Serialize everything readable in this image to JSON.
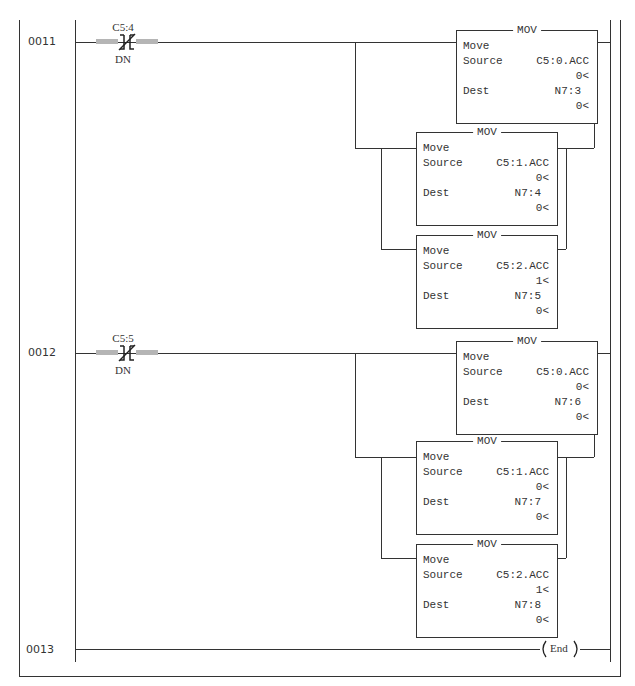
{
  "rungs": [
    {
      "number": "0011",
      "contact": {
        "address": "C5:4",
        "bit": "DN",
        "type": "XIO"
      },
      "instructions": [
        {
          "title": "MOV",
          "name": "Move",
          "source_label": "Source",
          "source": "C5:0.ACC",
          "source_value": "0<",
          "dest_label": "Dest",
          "dest": "N7:3",
          "dest_value": "0<"
        },
        {
          "title": "MOV",
          "name": "Move",
          "source_label": "Source",
          "source": "C5:1.ACC",
          "source_value": "0<",
          "dest_label": "Dest",
          "dest": "N7:4",
          "dest_value": "0<"
        },
        {
          "title": "MOV",
          "name": "Move",
          "source_label": "Source",
          "source": "C5:2.ACC",
          "source_value": "1<",
          "dest_label": "Dest",
          "dest": "N7:5",
          "dest_value": "0<"
        }
      ]
    },
    {
      "number": "0012",
      "contact": {
        "address": "C5:5",
        "bit": "DN",
        "type": "XIO"
      },
      "instructions": [
        {
          "title": "MOV",
          "name": "Move",
          "source_label": "Source",
          "source": "C5:0.ACC",
          "source_value": "0<",
          "dest_label": "Dest",
          "dest": "N7:6",
          "dest_value": "0<"
        },
        {
          "title": "MOV",
          "name": "Move",
          "source_label": "Source",
          "source": "C5:1.ACC",
          "source_value": "0<",
          "dest_label": "Dest",
          "dest": "N7:7",
          "dest_value": "0<"
        },
        {
          "title": "MOV",
          "name": "Move",
          "source_label": "Source",
          "source": "C5:2.ACC",
          "source_value": "1<",
          "dest_label": "Dest",
          "dest": "N7:8",
          "dest_value": "0<"
        }
      ]
    },
    {
      "number": "0013",
      "end_label": "End"
    }
  ],
  "colors": {
    "line": "#333333",
    "shade": "#b5b5b5",
    "background": "#ffffff"
  }
}
